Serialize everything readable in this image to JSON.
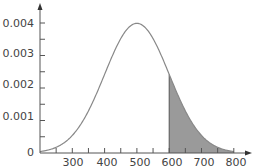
{
  "chart_data": {
    "type": "area",
    "title": "",
    "xlabel": "",
    "ylabel": "",
    "distribution": "normal",
    "mean": 500,
    "sd": 100,
    "xlim": [
      200,
      810
    ],
    "ylim": [
      0,
      0.0045
    ],
    "x_ticks": [
      300,
      400,
      500,
      600,
      700,
      800
    ],
    "x_minor_ticks": [
      250,
      350,
      450,
      550,
      650,
      750
    ],
    "y_ticks": [
      "0",
      "0.001",
      "0.002",
      "0.003",
      "0.004"
    ],
    "shaded_region": {
      "from": 600,
      "to": 800
    },
    "grid": false,
    "legend": null,
    "colors": {
      "curve": "#888888",
      "shade": "#9a9a9a",
      "axis": "#555555"
    }
  },
  "labels": {
    "x": [
      "300",
      "400",
      "500",
      "600",
      "700",
      "800"
    ],
    "y": [
      "0",
      "0.001",
      "0.002",
      "0.003",
      "0.004"
    ]
  }
}
